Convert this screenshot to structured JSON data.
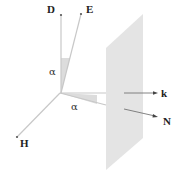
{
  "diagram": {
    "type": "vector-geometry",
    "origin": {
      "x": 60,
      "y": 93
    },
    "vectors": [
      {
        "id": "D",
        "label": "D",
        "end": {
          "x": 61,
          "y": 15
        }
      },
      {
        "id": "E",
        "label": "E",
        "end": {
          "x": 81,
          "y": 14
        }
      },
      {
        "id": "H",
        "label": "H",
        "end": {
          "x": 17,
          "y": 137
        }
      },
      {
        "id": "k",
        "label": "k",
        "end": {
          "x": 157,
          "y": 93
        }
      },
      {
        "id": "N",
        "label": "N",
        "end": {
          "x": 157,
          "y": 117
        }
      }
    ],
    "angles": [
      {
        "id": "alpha-DE",
        "label": "α",
        "between": [
          "D",
          "E"
        ]
      },
      {
        "id": "alpha-kN",
        "label": "α",
        "between": [
          "k",
          "N"
        ]
      }
    ],
    "plane": {
      "label": "",
      "color": "#e4e4e4"
    },
    "colors": {
      "line": "#c8c8c8",
      "arrow": "#555555",
      "wedge": "#dcdcdc",
      "text": "#222222"
    }
  }
}
